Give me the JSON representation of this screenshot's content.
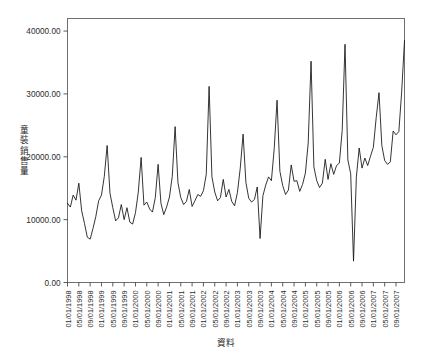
{
  "chart_data": {
    "type": "line",
    "title": "",
    "xlabel": "資料",
    "ylabel": "童裝銷售量",
    "ylim": [
      0,
      42000
    ],
    "ytick_labels": [
      "0.00",
      "10000.00",
      "20000.00",
      "30000.00",
      "40000.00"
    ],
    "ytick_values": [
      0,
      10000,
      20000,
      30000,
      40000
    ],
    "grid": false,
    "legend": "none",
    "line_color": "#111111",
    "background_color": "#ffffff",
    "frame_color": "#6f6f6f",
    "xtick_labels": [
      "01/01/1998",
      "05/01/1998",
      "09/01/1998",
      "01/01/1999",
      "05/01/1999",
      "09/01/1999",
      "01/01/2000",
      "05/01/2000",
      "09/01/2000",
      "01/01/2001",
      "05/01/2001",
      "09/01/2001",
      "01/01/2002",
      "05/01/2002",
      "09/01/2002",
      "01/01/2003",
      "05/01/2003",
      "09/01/2003",
      "01/01/2004",
      "05/01/2004",
      "09/01/2004",
      "01/01/2005",
      "05/01/2005",
      "09/01/2005",
      "01/01/2006",
      "05/01/2006",
      "09/01/2006",
      "01/01/2007",
      "05/01/2007",
      "09/01/2007"
    ],
    "x": [
      "01/1998",
      "02/1998",
      "03/1998",
      "04/1998",
      "05/1998",
      "06/1998",
      "07/1998",
      "08/1998",
      "09/1998",
      "10/1998",
      "11/1998",
      "12/1998",
      "01/1999",
      "02/1999",
      "03/1999",
      "04/1999",
      "05/1999",
      "06/1999",
      "07/1999",
      "08/1999",
      "09/1999",
      "10/1999",
      "11/1999",
      "12/1999",
      "01/2000",
      "02/2000",
      "03/2000",
      "04/2000",
      "05/2000",
      "06/2000",
      "07/2000",
      "08/2000",
      "09/2000",
      "10/2000",
      "11/2000",
      "12/2000",
      "01/2001",
      "02/2001",
      "03/2001",
      "04/2001",
      "05/2001",
      "06/2001",
      "07/2001",
      "08/2001",
      "09/2001",
      "10/2001",
      "11/2001",
      "12/2001",
      "01/2002",
      "02/2002",
      "03/2002",
      "04/2002",
      "05/2002",
      "06/2002",
      "07/2002",
      "08/2002",
      "09/2002",
      "10/2002",
      "11/2002",
      "12/2002",
      "01/2003",
      "02/2003",
      "03/2003",
      "04/2003",
      "05/2003",
      "06/2003",
      "07/2003",
      "08/2003",
      "09/2003",
      "10/2003",
      "11/2003",
      "12/2003",
      "01/2004",
      "02/2004",
      "03/2004",
      "04/2004",
      "05/2004",
      "06/2004",
      "07/2004",
      "08/2004",
      "09/2004",
      "10/2004",
      "11/2004",
      "12/2004",
      "01/2005",
      "02/2005",
      "03/2005",
      "04/2005",
      "05/2005",
      "06/2005",
      "07/2005",
      "08/2005",
      "09/2005",
      "10/2005",
      "11/2005",
      "12/2005",
      "01/2006",
      "02/2006",
      "03/2006",
      "04/2006",
      "05/2006",
      "06/2006",
      "07/2006",
      "08/2006",
      "09/2006",
      "10/2006",
      "11/2006",
      "12/2006",
      "01/2007",
      "02/2007",
      "03/2007",
      "04/2007",
      "05/2007",
      "06/2007",
      "07/2007",
      "08/2007",
      "09/2007",
      "10/2007",
      "11/2007",
      "12/2007"
    ],
    "values": [
      12600,
      12000,
      13900,
      13100,
      15800,
      11400,
      9400,
      7200,
      6900,
      8600,
      10500,
      13000,
      13900,
      16900,
      21800,
      14200,
      11900,
      9800,
      10300,
      12400,
      10000,
      11900,
      9600,
      9300,
      11100,
      14400,
      19900,
      12300,
      12800,
      11700,
      11200,
      13500,
      18800,
      12600,
      10800,
      12000,
      13600,
      16900,
      24800,
      15900,
      13500,
      12400,
      12900,
      14800,
      12100,
      13000,
      14000,
      13700,
      14600,
      17200,
      31200,
      16800,
      14400,
      13000,
      13500,
      16400,
      13600,
      14800,
      12900,
      12200,
      14300,
      18200,
      23600,
      15900,
      13400,
      12800,
      13200,
      15200,
      7000,
      13800,
      15500,
      16800,
      16200,
      21300,
      29000,
      17700,
      15400,
      14000,
      14700,
      18700,
      16100,
      16200,
      14500,
      15600,
      17400,
      22200,
      35200,
      18400,
      16200,
      15100,
      15800,
      19600,
      16400,
      18900,
      17200,
      18600,
      19000,
      24200,
      37900,
      19500,
      17300,
      3400,
      16800,
      21400,
      18200,
      19800,
      18600,
      20100,
      21500,
      26200,
      30200,
      21800,
      19400,
      18800,
      19200,
      24100,
      23500,
      24000,
      30300,
      38500
    ],
    "n_points": 120,
    "x_start": "01/1998",
    "x_end": "12/2007",
    "value_min": 3400,
    "value_max": 38500
  }
}
